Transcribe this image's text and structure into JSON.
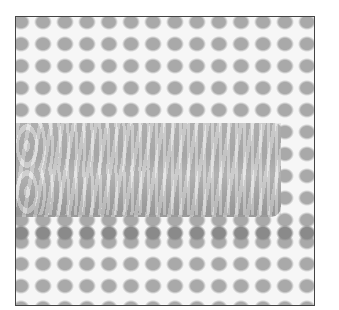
{
  "image": {
    "description": "Grayscale photo of plastic needlepoint canvas mesh with a horizontal band of stitching",
    "colors": {
      "background": "#ffffff",
      "mesh": "#f6f6f6",
      "holes": "#a9a9a9",
      "stitch_band": "#b6b6b6",
      "border": "#444444"
    }
  }
}
